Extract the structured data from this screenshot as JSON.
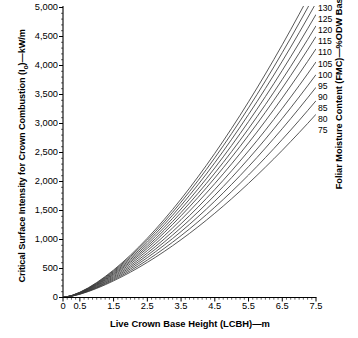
{
  "chart_data": {
    "type": "line",
    "title": "",
    "ylabel": "Critical Surface Intensity for Crown Combustion (I₀)—kW/m",
    "ylabel_prefix": "Critical Surface Intensity for Crown Combustion (I",
    "ylabel_sub": "o",
    "ylabel_suffix": ")—kW/m",
    "xlabel": "Live Crown Base Height (LCBH)—m",
    "right_axis_label": "Foliar Moisture Content (FMC)—%ODW Basis",
    "xlim": [
      0,
      7.5
    ],
    "ylim": [
      0,
      5000
    ],
    "xticks": [
      0,
      0.5,
      1.5,
      2.5,
      3.5,
      4.5,
      5.5,
      6.5,
      7.5
    ],
    "xtick_labels": [
      "0",
      "0.5",
      "1.5",
      "2.5",
      "3.5",
      "4.5",
      "5.5",
      "6.5",
      "7.5"
    ],
    "yticks": [
      0,
      500,
      1000,
      1500,
      2000,
      2500,
      3000,
      3500,
      4000,
      4500,
      5000
    ],
    "ytick_labels": [
      "0",
      "500",
      "1,000",
      "1,500",
      "2,000",
      "2,500",
      "3,000",
      "3,500",
      "4,000",
      "4,500",
      "5,000"
    ],
    "x_minor_tick_interval": 0.125,
    "y_minor_tick_interval": 100,
    "grid": false,
    "legend_position": "right-curve-labels",
    "legend_title": "Foliar Moisture Content (FMC)—%ODW Basis",
    "line_color": "#3a3a3a",
    "axis_color": "#000000",
    "series": [
      {
        "name": "130",
        "fmc": 130,
        "label": "130",
        "x": [
          0,
          0.25,
          0.5,
          0.75,
          1,
          1.25,
          1.5,
          1.75,
          2,
          2.25,
          2.5,
          2.75,
          3,
          3.25,
          3.5,
          3.75,
          4,
          4.25,
          4.5,
          4.75,
          5,
          5.25,
          5.5,
          5.75,
          6,
          6.25,
          6.5,
          6.75,
          7,
          7.25,
          7.5
        ],
        "y": [
          0,
          32,
          91,
          167,
          258,
          361,
          474,
          598,
          731,
          872,
          1022,
          1180,
          1345,
          1518,
          1698,
          1885,
          2079,
          2279,
          2486,
          2699,
          2918,
          3143,
          3374,
          3611,
          3854,
          4103,
          4358,
          4618,
          4884,
          5155,
          5432
        ]
      },
      {
        "name": "125",
        "fmc": 125,
        "label": "125",
        "x": [
          0,
          0.25,
          0.5,
          0.75,
          1,
          1.25,
          1.5,
          1.75,
          2,
          2.25,
          2.5,
          2.75,
          3,
          3.25,
          3.5,
          3.75,
          4,
          4.25,
          4.5,
          4.75,
          5,
          5.25,
          5.5,
          5.75,
          6,
          6.25,
          6.5,
          6.75,
          7,
          7.25,
          7.5
        ],
        "y": [
          0,
          31,
          88,
          162,
          250,
          350,
          459,
          579,
          708,
          845,
          990,
          1143,
          1303,
          1470,
          1645,
          1826,
          2014,
          2208,
          2409,
          2615,
          2828,
          3046,
          3270,
          3499,
          3734,
          3975,
          4222,
          4473,
          4731,
          4993,
          5261
        ]
      },
      {
        "name": "120",
        "fmc": 120,
        "label": "120",
        "x": [
          0,
          0.25,
          0.5,
          0.75,
          1,
          1.25,
          1.5,
          1.75,
          2,
          2.25,
          2.5,
          2.75,
          3,
          3.25,
          3.5,
          3.75,
          4,
          4.25,
          4.5,
          4.75,
          5,
          5.25,
          5.5,
          5.75,
          6,
          6.25,
          6.5,
          6.75,
          7,
          7.25,
          7.5
        ],
        "y": [
          0,
          30,
          85,
          156,
          241,
          338,
          443,
          559,
          683,
          815,
          955,
          1103,
          1257,
          1419,
          1587,
          1762,
          1943,
          2130,
          2324,
          2523,
          2728,
          2939,
          3155,
          3376,
          3603,
          3836,
          4074,
          4317,
          4565,
          4819,
          5077
        ]
      },
      {
        "name": "115",
        "fmc": 115,
        "label": "115",
        "x": [
          0,
          0.25,
          0.5,
          0.75,
          1,
          1.25,
          1.5,
          1.75,
          2,
          2.25,
          2.5,
          2.75,
          3,
          3.25,
          3.5,
          3.75,
          4,
          4.25,
          4.5,
          4.75,
          5,
          5.25,
          5.5,
          5.75,
          6,
          6.25,
          6.5,
          6.75,
          7,
          7.25,
          7.5
        ],
        "y": [
          0,
          29,
          82,
          150,
          232,
          325,
          427,
          538,
          657,
          784,
          919,
          1061,
          1209,
          1365,
          1526,
          1694,
          1868,
          2048,
          2234,
          2425,
          2622,
          2825,
          3033,
          3246,
          3464,
          3687,
          3916,
          4150,
          4388,
          4632,
          4880
        ]
      },
      {
        "name": "110",
        "fmc": 110,
        "label": "110",
        "x": [
          0,
          0.25,
          0.5,
          0.75,
          1,
          1.25,
          1.5,
          1.75,
          2,
          2.25,
          2.5,
          2.75,
          3,
          3.25,
          3.5,
          3.75,
          4,
          4.25,
          4.5,
          4.75,
          5,
          5.25,
          5.5,
          5.75,
          6,
          6.25,
          6.5,
          6.75,
          7,
          7.25,
          7.5
        ],
        "y": [
          0,
          28,
          79,
          145,
          223,
          313,
          410,
          517,
          631,
          753,
          883,
          1019,
          1162,
          1311,
          1466,
          1627,
          1794,
          1966,
          2145,
          2328,
          2517,
          2712,
          2911,
          3116,
          3325,
          3540,
          3759,
          3983,
          4212,
          4446,
          4684
        ]
      },
      {
        "name": "105",
        "fmc": 105,
        "label": "105",
        "x": [
          0,
          0.25,
          0.5,
          0.75,
          1,
          1.25,
          1.5,
          1.75,
          2,
          2.25,
          2.5,
          2.75,
          3,
          3.25,
          3.5,
          3.75,
          4,
          4.25,
          4.5,
          4.75,
          5,
          5.25,
          5.5,
          5.75,
          6,
          6.25,
          6.5,
          6.75,
          7,
          7.25,
          7.5
        ],
        "y": [
          0,
          27,
          76,
          139,
          215,
          301,
          395,
          497,
          607,
          724,
          848,
          979,
          1117,
          1260,
          1409,
          1564,
          1724,
          1890,
          2061,
          2237,
          2419,
          2605,
          2797,
          2993,
          3194,
          3400,
          3611,
          3826,
          4046,
          4270,
          4499
        ]
      },
      {
        "name": "100",
        "fmc": 100,
        "label": "100",
        "x": [
          0,
          0.25,
          0.5,
          0.75,
          1,
          1.25,
          1.5,
          1.75,
          2,
          2.25,
          2.5,
          2.75,
          3,
          3.25,
          3.5,
          3.75,
          4,
          4.25,
          4.5,
          4.75,
          5,
          5.25,
          5.5,
          5.75,
          6,
          6.25,
          6.5,
          6.75,
          7,
          7.25,
          7.5
        ],
        "y": [
          0,
          26,
          72,
          133,
          205,
          287,
          377,
          474,
          579,
          690,
          808,
          932,
          1063,
          1200,
          1342,
          1490,
          1643,
          1801,
          1964,
          2132,
          2305,
          2483,
          2665,
          2852,
          3044,
          3240,
          3441,
          3646,
          3856,
          4069,
          4287
        ]
      },
      {
        "name": "95",
        "fmc": 95,
        "label": "95",
        "x": [
          0,
          0.25,
          0.5,
          0.75,
          1,
          1.25,
          1.5,
          1.75,
          2,
          2.25,
          2.5,
          2.75,
          3,
          3.25,
          3.5,
          3.75,
          4,
          4.25,
          4.5,
          4.75,
          5,
          5.25,
          5.5,
          5.75,
          6,
          6.25,
          6.5,
          6.75,
          7,
          7.25,
          7.5
        ],
        "y": [
          0,
          25,
          69,
          126,
          195,
          273,
          358,
          450,
          549,
          655,
          766,
          884,
          1008,
          1137,
          1272,
          1412,
          1557,
          1707,
          1862,
          2021,
          2185,
          2354,
          2527,
          2704,
          2885,
          3071,
          3261,
          3455,
          3653,
          3855,
          4061
        ]
      },
      {
        "name": "90",
        "fmc": 90,
        "label": "90",
        "x": [
          0,
          0.25,
          0.5,
          0.75,
          1,
          1.25,
          1.5,
          1.75,
          2,
          2.25,
          2.5,
          2.75,
          3,
          3.25,
          3.5,
          3.75,
          4,
          4.25,
          4.5,
          4.75,
          5,
          5.25,
          5.5,
          5.75,
          6,
          6.25,
          6.5,
          6.75,
          7,
          7.25,
          7.5
        ],
        "y": [
          0,
          24,
          66,
          120,
          185,
          259,
          340,
          427,
          521,
          621,
          727,
          838,
          955,
          1077,
          1204,
          1336,
          1473,
          1615,
          1762,
          1913,
          2068,
          2228,
          2392,
          2560,
          2731,
          2907,
          3087,
          3270,
          3457,
          3648,
          3843
        ]
      },
      {
        "name": "85",
        "fmc": 85,
        "label": "85",
        "x": [
          0,
          0.25,
          0.5,
          0.75,
          1,
          1.25,
          1.5,
          1.75,
          2,
          2.25,
          2.5,
          2.75,
          3,
          3.25,
          3.5,
          3.75,
          4,
          4.25,
          4.5,
          4.75,
          5,
          5.25,
          5.5,
          5.75,
          6,
          6.25,
          6.5,
          6.75,
          7,
          7.25,
          7.5
        ],
        "y": [
          0,
          23,
          63,
          114,
          176,
          245,
          322,
          404,
          493,
          587,
          687,
          792,
          902,
          1017,
          1137,
          1261,
          1390,
          1524,
          1662,
          1804,
          1951,
          2101,
          2256,
          2414,
          2576,
          2742,
          2911,
          3084,
          3261,
          3441,
          3624
        ]
      },
      {
        "name": "80",
        "fmc": 80,
        "label": "80",
        "x": [
          0,
          0.25,
          0.5,
          0.75,
          1,
          1.25,
          1.5,
          1.75,
          2,
          2.25,
          2.5,
          2.75,
          3,
          3.25,
          3.5,
          3.75,
          4,
          4.25,
          4.5,
          4.75,
          5,
          5.25,
          5.5,
          5.75,
          6,
          6.25,
          6.5,
          6.75,
          7,
          7.25,
          7.5
        ],
        "y": [
          0,
          22,
          59,
          108,
          166,
          232,
          304,
          381,
          464,
          552,
          645,
          743,
          846,
          954,
          1066,
          1182,
          1303,
          1428,
          1557,
          1690,
          1827,
          1968,
          2112,
          2260,
          2412,
          2567,
          2726,
          2887,
          3052,
          3221,
          3392
        ]
      },
      {
        "name": "75",
        "fmc": 75,
        "label": "75",
        "x": [
          0,
          0.25,
          0.5,
          0.75,
          1,
          1.25,
          1.5,
          1.75,
          2,
          2.25,
          2.5,
          2.75,
          3,
          3.25,
          3.5,
          3.75,
          4,
          4.25,
          4.5,
          4.75,
          5,
          5.25,
          5.5,
          5.75,
          6,
          6.25,
          6.5,
          6.75,
          7,
          7.25,
          7.5
        ],
        "y": [
          0,
          21,
          56,
          102,
          157,
          219,
          287,
          360,
          437,
          519,
          606,
          697,
          793,
          893,
          997,
          1105,
          1217,
          1333,
          1453,
          1576,
          1703,
          1834,
          1968,
          2106,
          2247,
          2391,
          2538,
          2689,
          2843,
          2999,
          3159
        ]
      }
    ]
  }
}
